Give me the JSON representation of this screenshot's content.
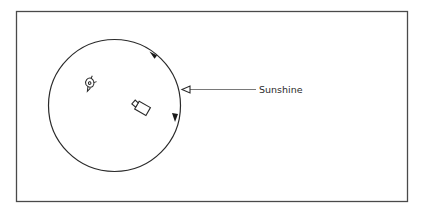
{
  "diagram": {
    "type": "orbit-illustration",
    "frame": {
      "x": 16,
      "y": 11,
      "width": 392,
      "height": 191,
      "stroke": "#4a4a4a"
    },
    "orbit": {
      "cx": 114.5,
      "cy": 105.5,
      "r": 66,
      "stroke": "#2a2a2a",
      "arrows": [
        {
          "name": "upper-arrow",
          "x": 152,
          "y": 55,
          "direction": "up-left"
        },
        {
          "name": "lower-arrow",
          "x": 175,
          "y": 118,
          "direction": "down"
        }
      ]
    },
    "objects": [
      {
        "name": "satellite-dish",
        "x": 90,
        "y": 84
      },
      {
        "name": "camera",
        "x": 141,
        "y": 108
      }
    ],
    "sunshine_pointer": {
      "label": "Sunshine",
      "line_start_x": 256,
      "line_end_x": 190,
      "y": 89.5,
      "stroke": "#6a6a6a"
    }
  }
}
